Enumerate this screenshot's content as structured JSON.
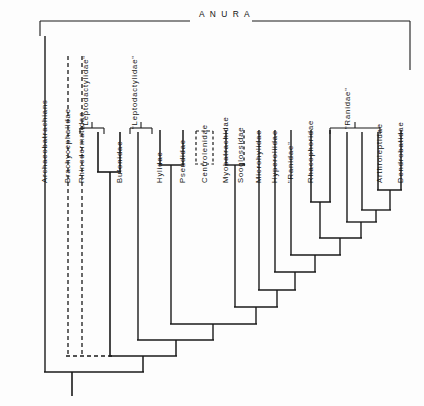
{
  "figure": {
    "type": "cladogram",
    "root_clade": {
      "name": "ANURA",
      "display": "A N U R A",
      "bracket": {
        "left_x": 40,
        "right_x": 410,
        "y": 21
      }
    },
    "line_color": "#1a1a1a",
    "background_color": "#fdfdfd"
  },
  "taxa": [
    {
      "id": "archaeobatrachians",
      "label": "Archaeobatrachians",
      "x": 45,
      "tip_y": 36,
      "style": "solid"
    },
    {
      "id": "brachycephalidae",
      "label": "Brachycephalidae",
      "x": 68,
      "tip_y": 56,
      "style": "dashed"
    },
    {
      "id": "rhinodermatidae",
      "label": "Rhinodermatidae",
      "x": 82,
      "tip_y": 56,
      "style": "dashed"
    },
    {
      "id": "leptodactylidae-1",
      "label": "\"Leptodactylidae\"",
      "x": 98,
      "tip_y": 128,
      "style": "solid"
    },
    {
      "id": "bufonidae",
      "label": "Bufonidae",
      "x": 120,
      "tip_y": 128,
      "style": "solid"
    },
    {
      "id": "leptodactylidae-2",
      "label": "\"Leptodactylidae\"",
      "x": 138,
      "tip_y": 128,
      "style": "solid"
    },
    {
      "id": "hylidae",
      "label": "Hylidae",
      "x": 160,
      "tip_y": 128,
      "style": "solid"
    },
    {
      "id": "pseudidae",
      "label": "Pseudidae",
      "x": 183,
      "tip_y": 128,
      "style": "solid"
    },
    {
      "id": "centrolenidae",
      "label": "Centrolenidae",
      "x": 205,
      "tip_y": 128,
      "style": "dashed"
    },
    {
      "id": "myobatrachidae",
      "label": "Myobatrachidae",
      "x": 226,
      "tip_y": 128,
      "style": "solid"
    },
    {
      "id": "sooglossidae",
      "label": "Sooglossidae",
      "x": 241,
      "tip_y": 128,
      "style": "dashed"
    },
    {
      "id": "microhylidae",
      "label": "Microhylidae",
      "x": 259,
      "tip_y": 128,
      "style": "solid"
    },
    {
      "id": "hyperoliidae",
      "label": "Hyperoliidae",
      "x": 275,
      "tip_y": 128,
      "style": "solid"
    },
    {
      "id": "ranidae-1",
      "label": "\"Ranidae\"",
      "x": 291,
      "tip_y": 128,
      "style": "solid"
    },
    {
      "id": "rhacophoridae",
      "label": "Rhacophoridae",
      "x": 311,
      "tip_y": 128,
      "style": "solid"
    },
    {
      "id": "ranidae-2",
      "label": "\"Ranidae\"",
      "x": 330,
      "tip_y": 128,
      "style": "solid"
    },
    {
      "id": "ranidae-3",
      "label": "",
      "x": 347,
      "tip_y": 128,
      "style": "solid"
    },
    {
      "id": "ranidae-4",
      "label": "",
      "x": 362,
      "tip_y": 128,
      "style": "solid"
    },
    {
      "id": "arthroleptidae",
      "label": "Arthroleptidae",
      "x": 380,
      "tip_y": 128,
      "style": "solid"
    },
    {
      "id": "dendrobatidae",
      "label": "Dendrobatidae",
      "x": 401,
      "tip_y": 128,
      "style": "solid"
    }
  ],
  "group_brackets": [
    {
      "id": "bracket-leptodactylidae-1",
      "label": "\"Leptodactylidae\"",
      "left_x": 80,
      "right_x": 98,
      "y": 128
    },
    {
      "id": "bracket-leptodactylidae-2",
      "label": "\"Leptodactylidae\"",
      "left_x": 130,
      "right_x": 148,
      "y": 128
    },
    {
      "id": "bracket-ranidae-2",
      "label": "\"Ranidae\"",
      "left_x": 330,
      "right_x": 380,
      "y": 128
    }
  ],
  "internal_nodes": [
    {
      "id": "node-bufonidae-clade",
      "children_x": [
        98,
        120
      ],
      "y": 172,
      "stem_to_y": 348
    },
    {
      "id": "node-hylidae-pseudidae",
      "children_x": [
        160,
        183
      ],
      "y": 165,
      "stem_to_y": 295
    },
    {
      "id": "node-myobatrachidae-sooglossidae",
      "children_x": [
        226,
        241
      ],
      "y": 165,
      "stem_to_y": 262
    },
    {
      "id": "node-rhacophoridae-ranidae2",
      "children_x": [
        311,
        330
      ],
      "y": 202,
      "stem_to_y": 245
    },
    {
      "id": "node-arthroleptidae-dendrobatidae",
      "children_x": [
        380,
        401
      ],
      "y": 197,
      "stem_to_y": 222
    },
    {
      "id": "node-ladder-a",
      "children_x": [
        347,
        390
      ],
      "y": 222,
      "stem_to_y": 238
    },
    {
      "id": "node-ladder-b",
      "children_x": [
        362,
        368
      ],
      "y": 238,
      "stem_to_y": 255
    },
    {
      "id": "node-ladder-c",
      "children_x": [
        320,
        365
      ],
      "y": 255,
      "stem_to_y": 272
    },
    {
      "id": "node-ladder-d",
      "children_x": [
        291,
        342
      ],
      "y": 272,
      "stem_to_y": 290
    },
    {
      "id": "node-ladder-e",
      "children_x": [
        275,
        316
      ],
      "y": 290,
      "stem_to_y": 307
    },
    {
      "id": "node-ladder-f",
      "children_x": [
        259,
        295
      ],
      "y": 307,
      "stem_to_y": 324
    },
    {
      "id": "node-ladder-g",
      "children_x": [
        205,
        277
      ],
      "y": 324,
      "stem_to_y": 340
    },
    {
      "id": "node-ladder-h",
      "children_x": [
        138,
        241
      ],
      "y": 340,
      "stem_to_y": 356
    },
    {
      "id": "node-ladder-i",
      "children_x": [
        110,
        190
      ],
      "y": 356,
      "stem_to_y": 372
    },
    {
      "id": "node-root",
      "children_x": [
        45,
        150
      ],
      "y": 372,
      "stem_to_y": 396
    }
  ],
  "dashed_connector": {
    "id": "brachycephalidae-rhinodermatidae-uncertain",
    "from_x": 68,
    "to_x": 110,
    "y": 356,
    "note": "uncertain placement shown with dashed lines"
  },
  "root_stem": {
    "x": 72,
    "from_y": 372,
    "to_y": 396
  }
}
